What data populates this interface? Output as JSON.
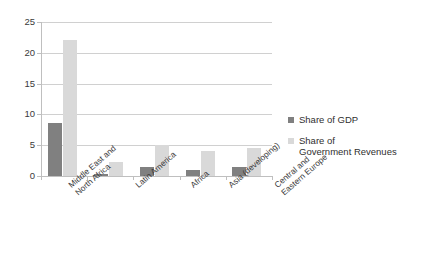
{
  "chart_data": {
    "type": "bar",
    "title": "",
    "xlabel": "",
    "ylabel": "",
    "ylim": [
      0,
      25
    ],
    "yticks": [
      0,
      5,
      10,
      15,
      20,
      25
    ],
    "ytick_labels": [
      "0",
      "5",
      "10",
      "15",
      "20",
      "25"
    ],
    "grid": true,
    "legend_position": "right",
    "categories": [
      "Middle East and\nNorth Africa",
      "Latin America",
      "Africa",
      "Asia (developing)",
      "Central and\nEastern Europe"
    ],
    "series": [
      {
        "name": "Share of GDP",
        "color": "#808080",
        "values": [
          8.6,
          0.4,
          1.5,
          1.0,
          1.5
        ]
      },
      {
        "name": "Share of\nGovernment Revenues",
        "color": "#d9d9d9",
        "values": [
          22.0,
          2.2,
          5.0,
          4.1,
          4.5
        ]
      }
    ]
  },
  "legend": {
    "entries": [
      {
        "label": "Share of GDP",
        "color": "#808080"
      },
      {
        "label": "Share of\nGovernment Revenues",
        "color": "#d9d9d9"
      }
    ]
  }
}
